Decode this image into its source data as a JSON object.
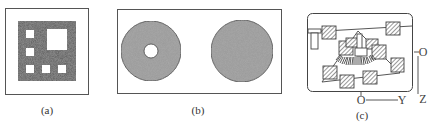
{
  "figure": {
    "panels": [
      {
        "id": "a",
        "caption": "(a)",
        "description": "Dark square with white square holes: one large hole and five small holes",
        "hole_count": 6
      },
      {
        "id": "b",
        "caption": "(b)",
        "description": "Two gray textured disks; left disk has a central circular hole, right disk is solid",
        "disk_count": 2
      },
      {
        "id": "c",
        "caption": "(c)",
        "description": "Schematic of hatched blocks connected by lines inside a rounded frame with O-Y and O-Z axes",
        "axes": {
          "origin_label_vertical": "O",
          "vertical_axis_label": "Z",
          "origin_label_horizontal": "O",
          "horizontal_axis_label": "Y"
        }
      }
    ],
    "colors": {
      "frame": "#555555",
      "dark_fill": "#555555",
      "disk_fill": "#9a9a9a",
      "hatch": "#444444",
      "background": "#ffffff"
    }
  }
}
